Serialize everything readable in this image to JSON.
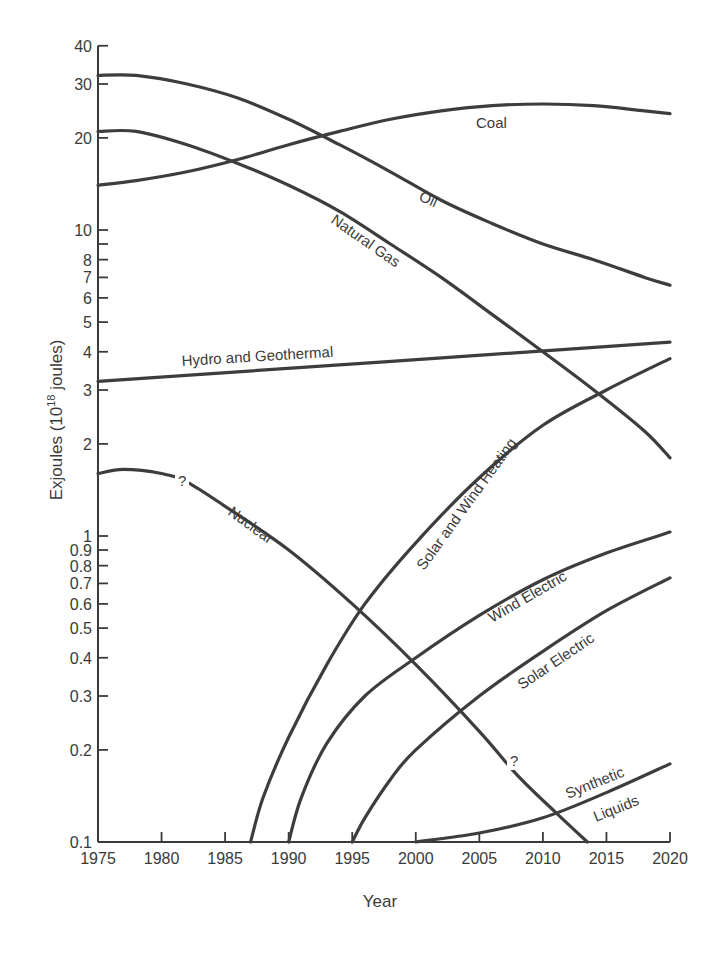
{
  "chart_data": {
    "type": "line",
    "title": "",
    "xlabel": "Year",
    "ylabel": "Exjoules (10^18 joules)",
    "ylabel_parts": {
      "main": "Exjoules (10",
      "sup": "18",
      "tail": " joules)"
    },
    "yscale": "log",
    "xlim": [
      1975,
      2020
    ],
    "ylim": [
      0.1,
      40
    ],
    "grid": false,
    "legend": "inline labels",
    "x_ticks": [
      1975,
      1980,
      1985,
      1990,
      1995,
      2000,
      2005,
      2010,
      2015,
      2020
    ],
    "y_ticks": [
      {
        "value": 40,
        "label": "40"
      },
      {
        "value": 30,
        "label": "30"
      },
      {
        "value": 20,
        "label": "20"
      },
      {
        "value": 10,
        "label": "10"
      },
      {
        "value": 9,
        "label": ""
      },
      {
        "value": 8,
        "label": "8"
      },
      {
        "value": 7,
        "label": "7"
      },
      {
        "value": 6,
        "label": "6"
      },
      {
        "value": 5,
        "label": "5"
      },
      {
        "value": 4,
        "label": "4"
      },
      {
        "value": 3,
        "label": "3"
      },
      {
        "value": 2,
        "label": "2"
      },
      {
        "value": 1,
        "label": "1"
      },
      {
        "value": 0.9,
        "label": "0.9"
      },
      {
        "value": 0.8,
        "label": "0.8"
      },
      {
        "value": 0.7,
        "label": "0.7"
      },
      {
        "value": 0.6,
        "label": "0.6"
      },
      {
        "value": 0.5,
        "label": "0.5"
      },
      {
        "value": 0.4,
        "label": "0.4"
      },
      {
        "value": 0.3,
        "label": "0.3"
      },
      {
        "value": 0.2,
        "label": "0.2"
      },
      {
        "value": 0.1,
        "label": "0.1"
      }
    ],
    "series": [
      {
        "name": "Oil",
        "x": [
          1975,
          1978,
          1982,
          1986,
          1990,
          1994,
          1998,
          2002,
          2006,
          2010,
          2014,
          2018,
          2020
        ],
        "values": [
          32,
          32,
          30,
          27,
          23,
          19,
          15.5,
          12.5,
          10.5,
          9,
          8,
          7,
          6.6
        ]
      },
      {
        "name": "Natural Gas",
        "x": [
          1975,
          1978,
          1982,
          1986,
          1990,
          1994,
          1998,
          2002,
          2006,
          2010,
          2014,
          2018,
          2020
        ],
        "values": [
          21,
          21,
          19,
          16.5,
          14,
          11.5,
          9,
          7,
          5.3,
          4,
          3,
          2.2,
          1.8
        ]
      },
      {
        "name": "Coal",
        "x": [
          1975,
          1978,
          1982,
          1986,
          1990,
          1994,
          1998,
          2002,
          2006,
          2010,
          2014,
          2018,
          2020
        ],
        "values": [
          14,
          14.5,
          15.5,
          17,
          19,
          21,
          23,
          24.5,
          25.5,
          25.8,
          25.5,
          24.5,
          24
        ]
      },
      {
        "name": "Hydro and Geothermal",
        "x": [
          1975,
          2020
        ],
        "values": [
          3.2,
          4.3
        ]
      },
      {
        "name": "Nuclear",
        "x": [
          1975,
          1977,
          1980,
          1982,
          1985,
          1990,
          1995,
          2000,
          2005,
          2008,
          2011,
          2013.5
        ],
        "values": [
          1.6,
          1.65,
          1.6,
          1.5,
          1.25,
          0.9,
          0.6,
          0.38,
          0.23,
          0.165,
          0.125,
          0.1
        ],
        "uncertain_markers_at_year": [
          1982,
          2008
        ]
      },
      {
        "name": "Solar and Wind Heating",
        "x": [
          1987,
          1988,
          1990,
          1993,
          1996,
          2000,
          2005,
          2010,
          2015,
          2020
        ],
        "values": [
          0.1,
          0.14,
          0.22,
          0.38,
          0.6,
          0.95,
          1.55,
          2.3,
          3.0,
          3.8
        ]
      },
      {
        "name": "Wind Electric",
        "x": [
          1990,
          1991,
          1993,
          1996,
          2000,
          2005,
          2010,
          2015,
          2020
        ],
        "values": [
          0.1,
          0.14,
          0.21,
          0.3,
          0.4,
          0.55,
          0.72,
          0.88,
          1.03
        ]
      },
      {
        "name": "Solar Electric",
        "x": [
          1995,
          1996,
          1998,
          2000,
          2005,
          2010,
          2015,
          2020
        ],
        "values": [
          0.1,
          0.12,
          0.16,
          0.2,
          0.3,
          0.42,
          0.57,
          0.73
        ]
      },
      {
        "name": "Synthetic Liquids",
        "x": [
          2000,
          2005,
          2010,
          2015,
          2020
        ],
        "values": [
          0.1,
          0.107,
          0.12,
          0.145,
          0.18
        ]
      }
    ]
  },
  "labels": {
    "xlabel": "Year",
    "ylabel_main": "Exjoules (10",
    "ylabel_sup": "18",
    "ylabel_tail": " joules)",
    "oil": "Oil",
    "gas": "Natural Gas",
    "coal": "Coal",
    "hydro": "Hydro and Geothermal",
    "nuclear": "Nuclear",
    "solar_wind_heating": "Solar and Wind Heating",
    "wind_electric": "Wind Electric",
    "solar_electric": "Solar Electric",
    "synthetic": "Synthetic",
    "liquids": "Liquids",
    "question_mark": "?"
  },
  "style": {
    "ink": "#3d3d3d",
    "background": "#ffffff"
  }
}
